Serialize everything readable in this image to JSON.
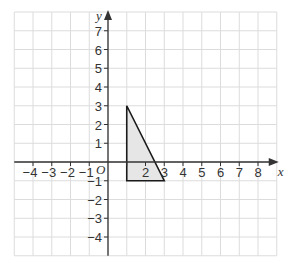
{
  "chart_data": {
    "type": "diagram",
    "title": "",
    "xlabel": "x",
    "ylabel": "y",
    "origin_label": "O",
    "xlim": [
      -5,
      9
    ],
    "ylim": [
      -5,
      8
    ],
    "grid": true,
    "x_tick_labels": [
      "−4",
      "−3",
      "−2",
      "−1",
      "2",
      "3",
      "4",
      "5",
      "6",
      "7",
      "8"
    ],
    "x_tick_values": [
      -4,
      -3,
      -2,
      -1,
      2,
      3,
      4,
      5,
      6,
      7,
      8
    ],
    "y_tick_labels": [
      "7",
      "6",
      "5",
      "4",
      "3",
      "2",
      "1",
      "−1",
      "−2",
      "−3",
      "−4"
    ],
    "y_tick_values": [
      7,
      6,
      5,
      4,
      3,
      2,
      1,
      -1,
      -2,
      -3,
      -4
    ],
    "shapes": [
      {
        "name": "triangle",
        "vertices": [
          [
            1,
            3
          ],
          [
            1,
            -1
          ],
          [
            3,
            -1
          ]
        ],
        "fill": "#e6e6e6",
        "stroke": "#1a1a1a"
      }
    ]
  },
  "colors": {
    "grid": "#dcdcdc",
    "axis": "#333333",
    "shape_fill": "#e6e6e6",
    "shape_stroke": "#1a1a1a"
  }
}
